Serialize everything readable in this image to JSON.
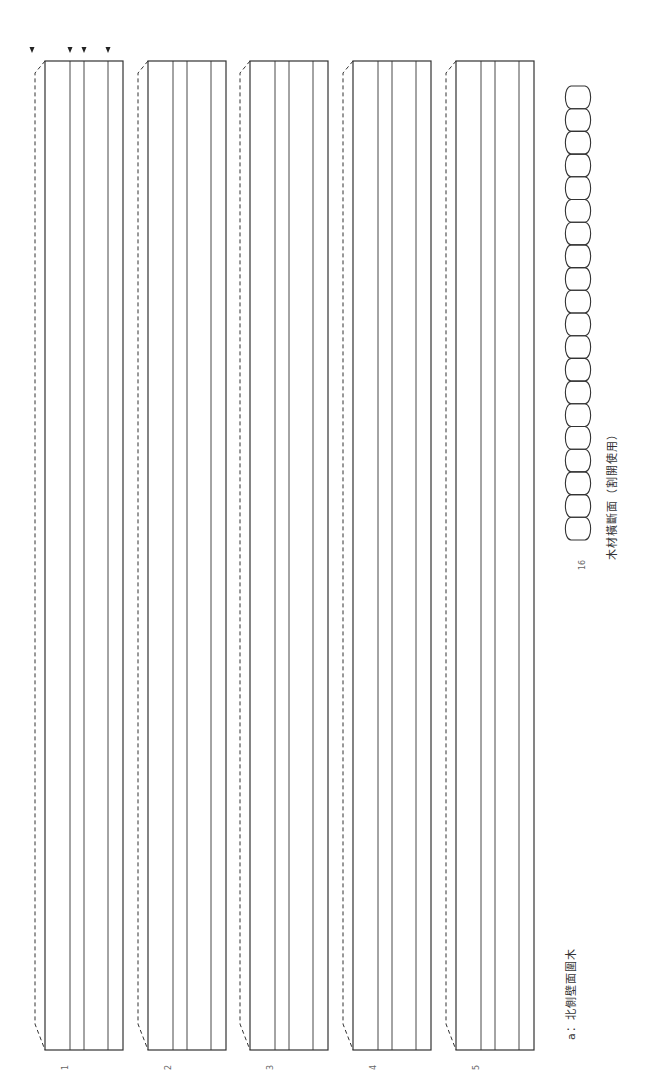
{
  "figure": {
    "caption": "a：北側壁面圍木",
    "section_caption": "木材橫斷面（割開使用）",
    "section_number": "16",
    "line_color": "#333333",
    "planks": [
      {
        "label": "1",
        "has_markers": true
      },
      {
        "label": "2",
        "has_markers": false
      },
      {
        "label": "3",
        "has_markers": false
      },
      {
        "label": "4",
        "has_markers": false
      },
      {
        "label": "5",
        "has_markers": false
      }
    ],
    "marker_count": 4,
    "log_cross_section_count": 20
  }
}
